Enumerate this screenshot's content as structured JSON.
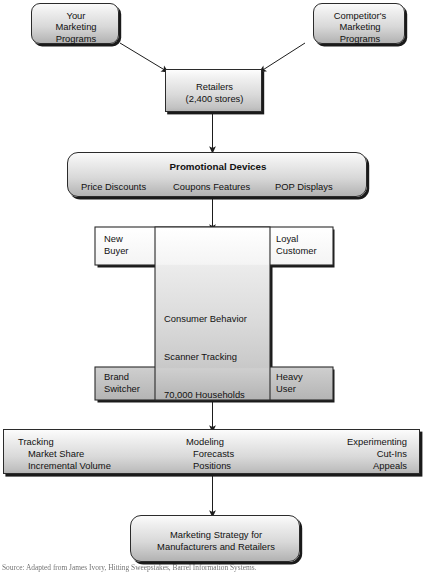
{
  "diagram": {
    "colors": {
      "box_fill_light": "#fbfbfb",
      "box_fill_dark": "#b2b2b2",
      "border": "#2b2b2b",
      "shadow": "#1a1a1a",
      "text": "#111111",
      "page_background": "#ffffff"
    },
    "nodes": {
      "your_programs": {
        "name": "your-marketing-programs",
        "shape": "rounded-rectangle",
        "lines": [
          "Your",
          "Marketing",
          "Programs"
        ]
      },
      "competitor_programs": {
        "name": "competitors-marketing-programs",
        "shape": "rounded-rectangle",
        "lines": [
          "Competitor's",
          "Marketing",
          "Programs"
        ]
      },
      "retailers": {
        "name": "retailers",
        "shape": "rectangle",
        "lines": [
          "Retailers",
          "(2,400 stores)"
        ]
      },
      "promotional_devices": {
        "name": "promotional-devices",
        "shape": "rounded-rectangle",
        "heading": "Promotional Devices",
        "items": [
          "Price Discounts",
          "Coupons Features",
          "POP Displays"
        ]
      },
      "consumer_panel": {
        "name": "consumer-behavior-panel",
        "shape": "h-beam",
        "center_lines": [
          "Consumer Behavior",
          "Scanner Tracking",
          "70,000 Households",
          "800,000 UPC Items"
        ],
        "corners": {
          "top_left": [
            "New",
            "Buyer"
          ],
          "top_right": [
            "Loyal",
            "Customer"
          ],
          "bottom_left": [
            "Brand",
            "Switcher"
          ],
          "bottom_right": [
            "Heavy",
            "User"
          ]
        }
      },
      "analytics_band": {
        "name": "analytics-applications-band",
        "shape": "rectangle",
        "columns": [
          {
            "heading": "Tracking",
            "items": [
              "Market Share",
              "Incremental Volume"
            ]
          },
          {
            "heading": "Modeling",
            "items": [
              "Forecasts",
              "Positions"
            ]
          },
          {
            "heading": "Experimenting",
            "items": [
              "Cut-Ins",
              "Appeals"
            ]
          }
        ]
      },
      "marketing_strategy": {
        "name": "marketing-strategy-outcome",
        "shape": "rounded-rectangle",
        "lines": [
          "Marketing Strategy for",
          "Manufacturers and Retailers"
        ]
      }
    },
    "connectors": [
      {
        "name": "arrow-your-programs-to-retailers",
        "from": "your_programs",
        "to": "retailers",
        "style": "diagonal-arrow"
      },
      {
        "name": "arrow-competitor-programs-to-retailers",
        "from": "competitor_programs",
        "to": "retailers",
        "style": "diagonal-arrow"
      },
      {
        "name": "arrow-retailers-to-promotional-devices",
        "from": "retailers",
        "to": "promotional_devices",
        "style": "vertical-arrow"
      },
      {
        "name": "arrow-promotional-devices-to-consumer-panel",
        "from": "promotional_devices",
        "to": "consumer_panel",
        "style": "vertical-arrow"
      },
      {
        "name": "arrow-consumer-panel-to-analytics-band",
        "from": "consumer_panel",
        "to": "analytics_band",
        "style": "vertical-arrow"
      },
      {
        "name": "arrow-analytics-band-to-marketing-strategy",
        "from": "analytics_band",
        "to": "marketing_strategy",
        "style": "vertical-arrow"
      }
    ],
    "caption": "Source: Adapted from James Ivory, Hitting Sweepstakes, Barrel Information Systems."
  }
}
